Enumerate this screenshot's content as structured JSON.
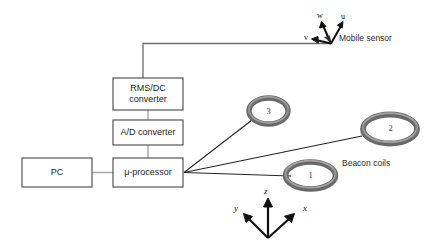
{
  "diagram": {
    "blocks": [
      {
        "id": "pc",
        "label": "PC"
      },
      {
        "id": "rms_dc",
        "label_line1": "RMS/DC",
        "label_line2": "converter"
      },
      {
        "id": "ad",
        "label": "A/D converter"
      },
      {
        "id": "uproc",
        "label": "μ-processor"
      }
    ],
    "coils": [
      {
        "id": "coil3",
        "number": "3"
      },
      {
        "id": "coil2",
        "number": "2"
      },
      {
        "id": "coil1",
        "number": "1"
      }
    ],
    "labels": {
      "mobile_sensor": "Mobile sensor",
      "beacon_coils": "Beacon coils"
    },
    "sensor_axes": [
      {
        "id": "u",
        "label": "u"
      },
      {
        "id": "v",
        "label": "v"
      },
      {
        "id": "w",
        "label": "w"
      }
    ],
    "global_axes": [
      {
        "id": "x",
        "label": "x"
      },
      {
        "id": "y",
        "label": "y"
      },
      {
        "id": "z",
        "label": "z"
      }
    ],
    "colors": {
      "background": "#ffffff",
      "box_stroke": "#555555",
      "wire": "#8f8f8f",
      "beam": "#1b1b1b",
      "coil_outer": "#6f6f6f",
      "coil_inner": "#9a9a9a",
      "text": "#2b2b2b",
      "arrow": "#111111"
    }
  }
}
